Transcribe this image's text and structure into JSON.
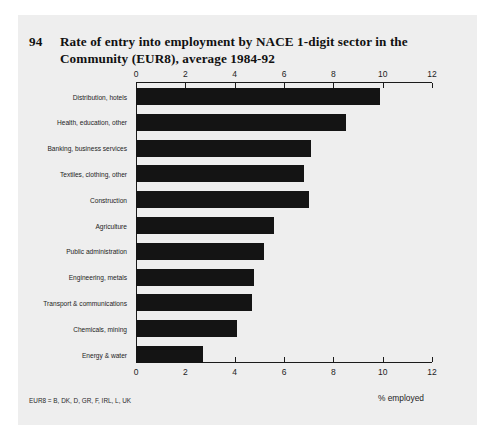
{
  "figure": {
    "number": "94",
    "title": "Rate of entry into employment by NACE 1-digit sector in the Community (EUR8), average 1984-92",
    "footnote": "EUR8 = B, DK, D, GR, F, IRL, L, UK"
  },
  "chart_data": {
    "type": "bar",
    "orientation": "horizontal",
    "title": "Rate of entry into employment by NACE 1-digit sector in the Community (EUR8), average 1984-92",
    "xlabel": "% employed",
    "ylabel": "",
    "xlim": [
      0,
      12
    ],
    "xticks": [
      "0",
      "2",
      "4",
      "6",
      "8",
      "10",
      "12"
    ],
    "xtick_values": [
      0,
      2,
      4,
      6,
      8,
      10,
      12
    ],
    "grid": false,
    "legend": null,
    "axis_ticks_position": "top and bottom",
    "bar_color": "#141414",
    "categories": [
      "Distribution, hotels",
      "Health, education, other",
      "Banking, business services",
      "Textiles, clothing, other",
      "Construction",
      "Agriculture",
      "Public administration",
      "Engineering, metals",
      "Transport & communications",
      "Chemicals, mining",
      "Energy & water"
    ],
    "values": [
      9.9,
      8.5,
      7.1,
      6.8,
      7.0,
      5.6,
      5.2,
      4.8,
      4.7,
      4.1,
      2.7
    ]
  },
  "colors": {
    "card_background": "#eeeeee",
    "page_background": "#ffffff",
    "bar": "#141414",
    "axis": "#1a1a1a",
    "text": "#1d1d1d"
  }
}
